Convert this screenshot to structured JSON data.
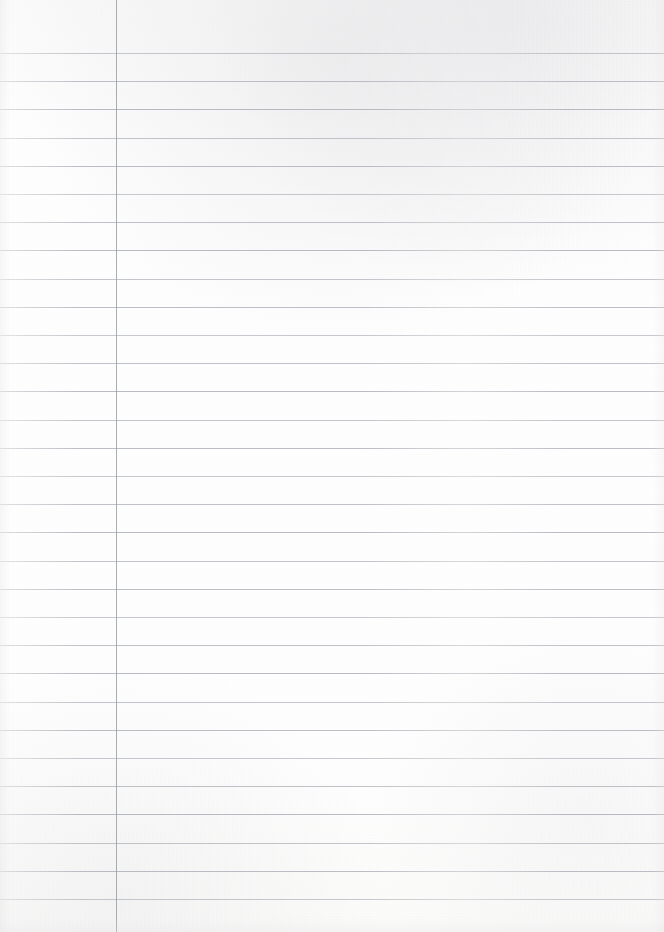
{
  "page": {
    "kind": "lined-notebook-paper",
    "width": 664,
    "height": 932,
    "paper_color": "#fdfdfc",
    "content_text": "",
    "note": ""
  },
  "ruling": {
    "rule_color": "#9ea3ab",
    "first_line_y": 53,
    "line_spacing": 28.2,
    "line_count": 31,
    "line_thickness": 1,
    "line_y_positions": [
      53,
      81,
      109,
      138,
      166,
      194,
      222,
      250,
      279,
      307,
      335,
      363,
      391,
      420,
      448,
      476,
      504,
      532,
      561,
      589,
      617,
      645,
      673,
      702,
      730,
      758,
      786,
      814,
      843,
      871,
      899
    ]
  },
  "margin": {
    "margin_color": "#8f96a0",
    "margin_x": 116,
    "margin_thickness": 1,
    "margin_top": 0,
    "margin_bottom": 932
  }
}
